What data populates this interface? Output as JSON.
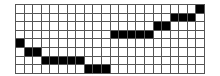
{
  "grid": {
    "rows": 8,
    "cols": 22,
    "fill_color": "#000000",
    "empty_color": "#ffffff",
    "line_color": "#555555",
    "filled_cells": [
      {
        "row": 4,
        "cols": [
          0
        ]
      },
      {
        "row": 5,
        "cols": [
          1,
          2
        ]
      },
      {
        "row": 6,
        "cols": [
          3,
          4,
          5,
          6,
          7
        ]
      },
      {
        "row": 7,
        "cols": [
          8,
          9,
          10
        ]
      },
      {
        "row": 3,
        "cols": [
          11,
          12,
          13,
          14,
          15
        ]
      },
      {
        "row": 2,
        "cols": [
          16,
          17
        ]
      },
      {
        "row": 1,
        "cols": [
          18,
          19,
          20
        ]
      },
      {
        "row": 0,
        "cols": [
          21
        ]
      }
    ]
  }
}
